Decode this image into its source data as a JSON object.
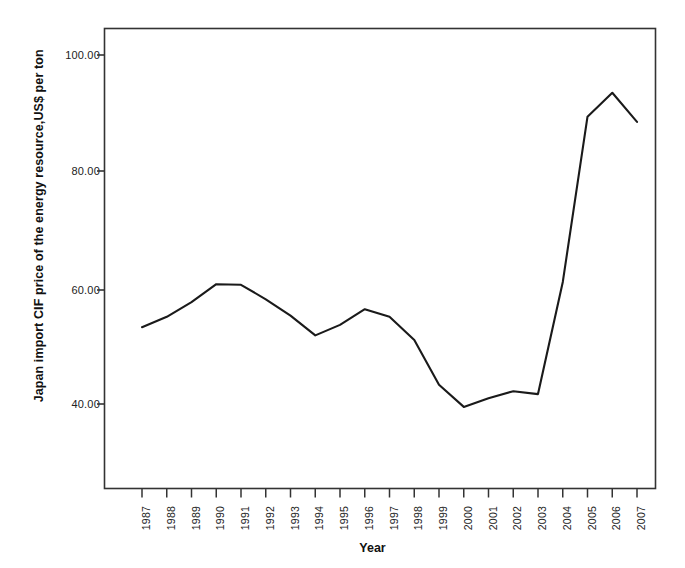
{
  "chart_data": {
    "type": "line",
    "title": "",
    "xlabel": "Year",
    "ylabel": "Japan import CIF price of the energy resource,US$ per ton",
    "categories": [
      "1987",
      "1988",
      "1989",
      "1990",
      "1991",
      "1992",
      "1993",
      "1994",
      "1995",
      "1996",
      "1997",
      "1998",
      "1999",
      "2000",
      "2001",
      "2002",
      "2003",
      "2004",
      "2005",
      "2006",
      "2007"
    ],
    "values": [
      53.2,
      55.0,
      57.5,
      60.6,
      60.5,
      58.0,
      55.2,
      51.8,
      53.6,
      56.3,
      55.0,
      51.0,
      43.3,
      39.5,
      41.0,
      42.2,
      41.7,
      61.0,
      89.4,
      93.5,
      88.5
    ],
    "series": [
      {
        "name": "Japan import CIF price of the energy resource",
        "values": [
          53.2,
          55.0,
          57.5,
          60.6,
          60.5,
          58.0,
          55.2,
          51.8,
          53.6,
          56.3,
          55.0,
          51.0,
          43.3,
          39.5,
          41.0,
          42.2,
          41.7,
          61.0,
          89.4,
          93.5,
          88.5
        ]
      }
    ],
    "y_tick_labels": [
      "100.00",
      "80.00",
      "60.00",
      "40.00"
    ],
    "y_tick_values": [
      100,
      80,
      60,
      40
    ],
    "ylim": [
      30.0,
      104.0
    ],
    "xlim": [
      "1987",
      "2007"
    ],
    "grid": false,
    "legend": "none",
    "line_color": "#1a1a1a",
    "line_width": 2,
    "axis_color": "#333333",
    "background_color": "#ffffff"
  },
  "axes": {
    "x_title": "Year",
    "y_title": "Japan import CIF price of the energy resource,US$ per ton"
  }
}
